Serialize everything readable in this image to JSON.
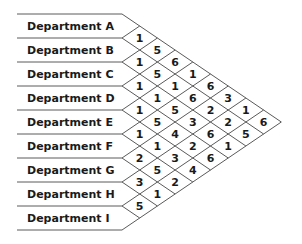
{
  "diagram": {
    "title": "",
    "departments": [
      "Department A",
      "Department B",
      "Department C",
      "Department D",
      "Department E",
      "Department F",
      "Department G",
      "Department H",
      "Department I"
    ],
    "matrix_columns": [
      [
        1,
        1,
        1,
        1,
        1,
        2,
        3,
        5
      ],
      [
        5,
        5,
        1,
        5,
        1,
        5,
        1
      ],
      [
        6,
        1,
        5,
        4,
        3,
        2
      ],
      [
        1,
        6,
        3,
        2,
        4
      ],
      [
        6,
        2,
        6,
        6
      ],
      [
        3,
        2,
        1
      ],
      [
        1,
        5
      ],
      [
        6
      ]
    ],
    "colors": {
      "line": "#5a5a5a",
      "text": "#1a1a1a",
      "background": "#ffffff"
    }
  }
}
